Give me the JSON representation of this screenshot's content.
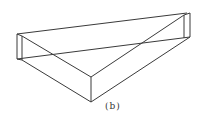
{
  "figure": {
    "caption": "(b)"
  }
}
